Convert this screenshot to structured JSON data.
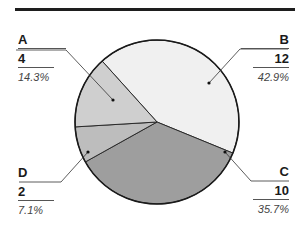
{
  "chart_data": {
    "type": "pie",
    "title": "",
    "categories": [
      "A",
      "B",
      "C",
      "D"
    ],
    "values": [
      4,
      12,
      10,
      2
    ],
    "percentages": [
      "14.3%",
      "42.9%",
      "35.7%",
      "7.1%"
    ],
    "colors": [
      "#cfcfcf",
      "#f0f0f0",
      "#9e9e9e",
      "#bdbdbd"
    ],
    "start_angle_deg": -42,
    "direction": "clockwise_from_top_order_B_C_D_A",
    "legend": "callout labels"
  },
  "labels": {
    "A": {
      "name": "A",
      "value": "4",
      "pct": "14.3%"
    },
    "B": {
      "name": "B",
      "value": "12",
      "pct": "42.9%"
    },
    "C": {
      "name": "C",
      "value": "10",
      "pct": "35.7%"
    },
    "D": {
      "name": "D",
      "value": "2",
      "pct": "7.1%"
    }
  }
}
